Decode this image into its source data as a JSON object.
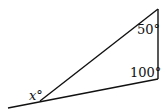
{
  "diagram": {
    "type": "geometry-triangle",
    "colors": {
      "stroke": "#111111",
      "background": "#ffffff"
    },
    "vertices": {
      "top": [
        158,
        9
      ],
      "right": [
        158,
        79
      ],
      "left": [
        40,
        101
      ]
    },
    "baseline_extension_start": [
      8,
      108
    ],
    "labels": {
      "top_angle": "50°",
      "right_angle": "100°",
      "exterior_angle": "x°"
    }
  }
}
